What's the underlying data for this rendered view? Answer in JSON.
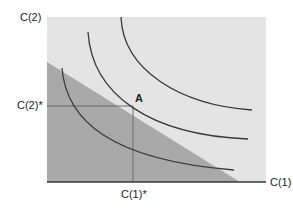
{
  "diagram": {
    "type": "indifference-curves-budget-constraint",
    "y_axis_label": "C(2)",
    "x_axis_label": "C(1)",
    "y_star_label": "C(2)*",
    "x_star_label": "C(1)*",
    "point_label": "A",
    "colors": {
      "background_region": "#e4e4e4",
      "budget_region": "#a9a9a9",
      "curves": "#3a3a3a",
      "axes": "#3a3a3a",
      "guide_lines": "#6a6a6a"
    },
    "curves": [
      {
        "name": "inner-indifference-curve"
      },
      {
        "name": "middle-indifference-curve"
      },
      {
        "name": "outer-indifference-curve"
      }
    ]
  }
}
